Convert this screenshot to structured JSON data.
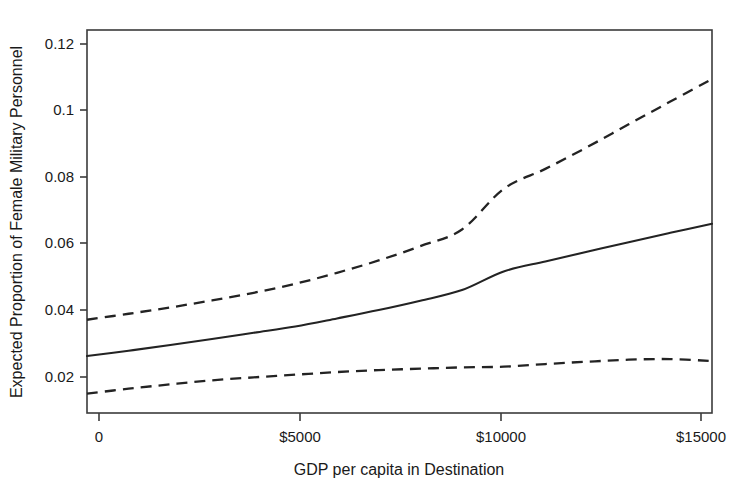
{
  "chart_data": {
    "type": "line",
    "title": "",
    "subtitle": "",
    "xlabel": "GDP per capita in Destination",
    "ylabel": "Expected Proportion of Female Military Personnel",
    "xlim": [
      0,
      15000
    ],
    "ylim": [
      0.0125,
      0.1275
    ],
    "grid": false,
    "legend_position": "none",
    "legend": [],
    "annotations": [],
    "xticks": [
      0,
      5000,
      10000,
      15000
    ],
    "xticklabels": [
      "0",
      "$5000",
      "$10000",
      "$15000"
    ],
    "yticks": [
      0.02,
      0.04,
      0.06,
      0.08,
      0.1,
      0.12
    ],
    "yticklabels": [
      "0.02",
      "0.04",
      "0.06",
      "0.08",
      "0.1",
      "0.12"
    ],
    "x": [
      0,
      1000,
      2000,
      3000,
      4000,
      5000,
      6000,
      7000,
      8000,
      9000,
      10000,
      11000,
      12000,
      13000,
      14000,
      15000
    ],
    "series": [
      {
        "name": "Upper 95% confidence bound",
        "style": "dashed",
        "color": "#232323",
        "values": [
          0.0405,
          0.0423,
          0.0442,
          0.0463,
          0.0486,
          0.0513,
          0.0546,
          0.0583,
          0.0626,
          0.0676,
          0.0798,
          0.0858,
          0.0923,
          0.0992,
          0.106,
          0.1128
        ]
      },
      {
        "name": "Expected proportion (fitted)",
        "style": "solid",
        "color": "#232323",
        "values": [
          0.0296,
          0.0312,
          0.0329,
          0.0347,
          0.0366,
          0.0385,
          0.0409,
          0.0434,
          0.0462,
          0.0494,
          0.055,
          0.058,
          0.0609,
          0.0638,
          0.0666,
          0.0693
        ]
      },
      {
        "name": "Lower 95% confidence bound",
        "style": "dashed",
        "color": "#232323",
        "values": [
          0.0183,
          0.0198,
          0.0211,
          0.0223,
          0.0232,
          0.024,
          0.0248,
          0.0254,
          0.0258,
          0.0262,
          0.0264,
          0.0272,
          0.0279,
          0.0285,
          0.0287,
          0.0281
        ]
      }
    ]
  },
  "axes": {
    "x_title": "GDP per capita in Destination",
    "y_title": "Expected Proportion of Female Military Personnel",
    "x_tick_labels": [
      "0",
      "$5000",
      "$10000",
      "$15000"
    ],
    "y_tick_labels": [
      "0.02",
      "0.04",
      "0.06",
      "0.08",
      "0.1",
      "0.12"
    ]
  },
  "colors": {
    "line": "#232323",
    "frame": "#3b3b3b",
    "text": "#1a1a1a",
    "background": "#ffffff"
  }
}
